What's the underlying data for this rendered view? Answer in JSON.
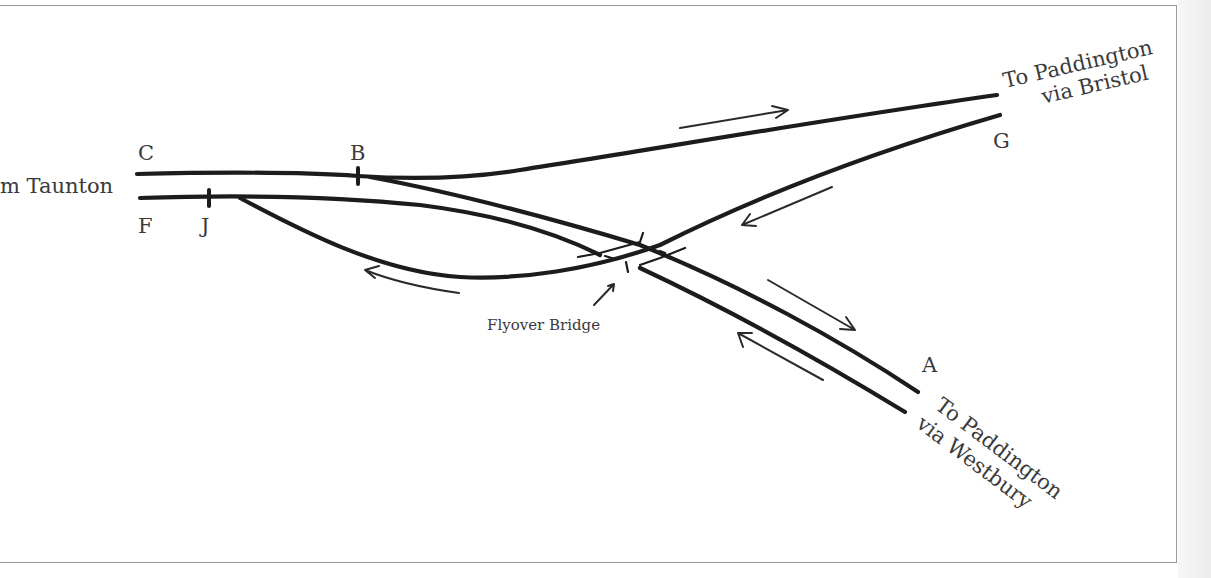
{
  "diagram": {
    "labels": {
      "from_taunton": "m Taunton",
      "to_bristol_line1": "To Paddington",
      "to_bristol_line2": "via Bristol",
      "to_westbury_line1": "To Paddington",
      "to_westbury_line2": "via Westbury",
      "flyover": "Flyover Bridge"
    },
    "points": {
      "C": "C",
      "B": "B",
      "F": "F",
      "J": "J",
      "G": "G",
      "A": "A"
    },
    "colors": {
      "track": "#1c1c1c",
      "text": "#3a3a3a",
      "frame": "#9a9a9a"
    }
  }
}
